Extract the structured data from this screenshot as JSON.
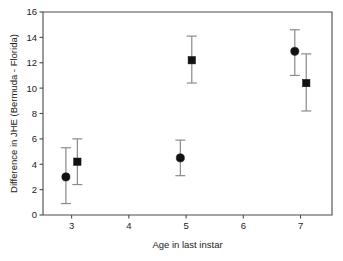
{
  "chart_data": {
    "type": "scatter",
    "title": "",
    "subtitle": "",
    "xlabel": "Age in last instar",
    "ylabel": "Difference in JHE (Bermuda - Florida)",
    "xlim": [
      2.5,
      7.55
    ],
    "ylim": [
      0,
      16
    ],
    "xticks": [
      3,
      4,
      5,
      6,
      7
    ],
    "xticklabels": [
      "3",
      "4",
      "5",
      "6",
      "7"
    ],
    "yticks": [
      0,
      2,
      4,
      6,
      8,
      10,
      12,
      14,
      16
    ],
    "yticklabels": [
      "0",
      "2",
      "4",
      "6",
      "8",
      "10",
      "12",
      "14",
      "16"
    ],
    "grid": false,
    "legend": "none",
    "error_bars": "vertical",
    "series": [
      {
        "name": "circle-series",
        "marker": "circle",
        "color": "#121212",
        "points": [
          {
            "x": 2.9,
            "y": 3.0,
            "ylow": 0.9,
            "yhigh": 5.3
          },
          {
            "x": 4.9,
            "y": 4.5,
            "ylow": 3.1,
            "yhigh": 5.9
          },
          {
            "x": 6.9,
            "y": 12.9,
            "ylow": 11.0,
            "yhigh": 14.6
          }
        ]
      },
      {
        "name": "square-series",
        "marker": "square",
        "color": "#121212",
        "points": [
          {
            "x": 3.1,
            "y": 4.2,
            "ylow": 2.4,
            "yhigh": 6.0
          },
          {
            "x": 5.1,
            "y": 12.2,
            "ylow": 10.4,
            "yhigh": 14.1
          },
          {
            "x": 7.1,
            "y": 10.4,
            "ylow": 8.2,
            "yhigh": 12.7
          }
        ]
      }
    ]
  },
  "axes": {
    "plot_left_px": 43,
    "plot_right_px": 332,
    "plot_top_px": 12,
    "plot_bottom_px": 215
  }
}
